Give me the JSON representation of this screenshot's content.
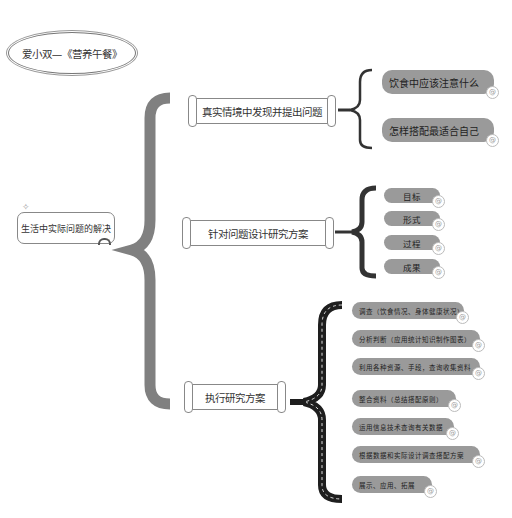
{
  "title": "爱小双—《营养午餐》",
  "root": {
    "label": "生活中实际问题的解决"
  },
  "branches": [
    {
      "label": "真实情境中发现并提出问题",
      "children": [
        "饮食中应该注意什么",
        "怎样搭配最适合自己"
      ]
    },
    {
      "label": "针对问题设计研究方案",
      "children": [
        "目标",
        "形式",
        "过程",
        "成果"
      ]
    },
    {
      "label": "执行研究方案",
      "children": [
        "调查（饮食情况、身体健康状况）",
        "分析判断（应用统计知识制作图表）",
        "利用各种资源、手段，查询收集资料",
        "整合资料（总结搭配原则）",
        "运用信息技术查询有关数据",
        "根据数据和实际设计调查搭配方案",
        "展示、应用、拓展"
      ]
    }
  ],
  "icons": {
    "leaf_marker": "@",
    "root_decoration": "✧"
  },
  "colors": {
    "pill": "#9a9a9a",
    "main_brace": "#777777",
    "road_brace": "#222222",
    "small_brace": "#333333"
  }
}
